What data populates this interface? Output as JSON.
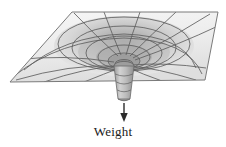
{
  "figure": {
    "caption_label": "Weight",
    "background_color": "#ffffff"
  },
  "annotation": {
    "force_label": "Weight",
    "arrow_direction": "down"
  },
  "colors": {
    "plane_fill_light": "#f2f2f2",
    "plane_fill_mid": "#e2e2e2",
    "plane_fill_dark": "#cfcfcf",
    "funnel_shadow": "#b5b5b5",
    "grid_line": "#5a5a5a",
    "outline": "#6e6e6e",
    "arrow": "#2b2b2b",
    "text": "#1a1a1a"
  },
  "geometry": {
    "plane_corners": "72,12 218,12 205,80 10,82",
    "funnel_center_x": 124,
    "funnel_center_y": 58,
    "stem_bottom_y": 100,
    "arrow_top_y": 103,
    "arrow_bottom_y": 121
  }
}
